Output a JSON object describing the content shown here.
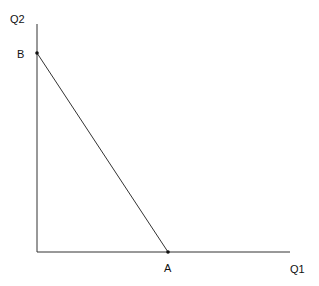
{
  "diagram": {
    "y_axis_label": "Q2",
    "x_axis_label": "Q1",
    "point_b_label": "B",
    "point_a_label": "A",
    "line_color": "#333333"
  }
}
